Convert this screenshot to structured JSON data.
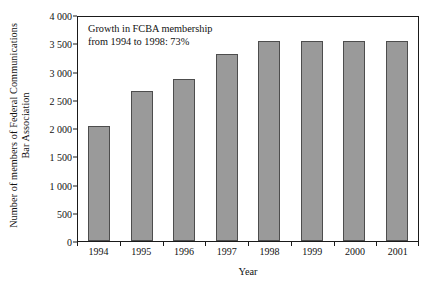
{
  "chart_data": {
    "type": "bar",
    "title": "",
    "categories": [
      "1994",
      "1995",
      "1996",
      "1997",
      "1998",
      "1999",
      "2000",
      "2001"
    ],
    "values": [
      2040,
      2660,
      2880,
      3330,
      3560,
      3550,
      3560,
      3550
    ],
    "series": [
      {
        "name": "Number of members of Federal Communications Bar Association",
        "values": [
          2040,
          2660,
          2880,
          3330,
          3560,
          3550,
          3560,
          3550
        ]
      }
    ],
    "xlabel": "Year",
    "ylabel": "Number of members of Federal Communications Bar Association",
    "ylabel_line1": "Number of members of Federal Communications",
    "ylabel_line2": "Bar Association",
    "ylim": [
      0,
      4000
    ],
    "ytick_values": [
      0,
      500,
      1000,
      1500,
      2000,
      2500,
      3000,
      3500,
      4000
    ],
    "ytick_labels": [
      "0",
      "500",
      "1 000",
      "1 500",
      "2 000",
      "2 500",
      "3 000",
      "3 500",
      "4 000"
    ],
    "grid": false,
    "legend": null,
    "annotations": [
      "Growth in FCBA membership",
      "from 1994 to 1998: 73%"
    ],
    "colors": {
      "bar_fill": "#9a9a9a",
      "bar_edge": "#4d4d4d",
      "axis": "#1a1a1a",
      "text": "#111111",
      "background": "#ffffff"
    }
  }
}
